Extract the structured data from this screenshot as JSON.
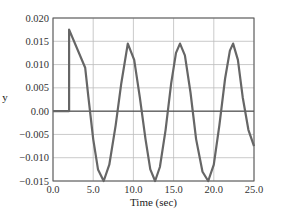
{
  "chart_data": {
    "type": "line",
    "title": "",
    "xlabel": "Time (sec)",
    "ylabel": "y",
    "xlim": [
      0.0,
      25.0
    ],
    "ylim": [
      -0.015,
      0.02
    ],
    "grid": true,
    "legend": null,
    "x_ticks": [
      0.0,
      5.0,
      10.0,
      15.0,
      20.0,
      25.0
    ],
    "x_tick_labels": [
      "0.0",
      "5.0",
      "10.0",
      "15.0",
      "20.0",
      "25.0"
    ],
    "y_ticks": [
      0.02,
      0.015,
      0.01,
      0.005,
      0.0,
      -0.005,
      -0.01,
      -0.015
    ],
    "y_tick_labels": [
      "0.020",
      "0.015",
      "0.010",
      "0.005",
      "0.00",
      "−0.005",
      "−0.010",
      "−0.015"
    ],
    "series": [
      {
        "name": "y",
        "color": "#666666",
        "x": [
          0.0,
          2.0,
          2.0,
          4.0,
          4.4,
          5.0,
          5.6,
          6.3,
          7.0,
          7.8,
          8.5,
          9.3,
          10.1,
          10.8,
          11.5,
          12.1,
          12.7,
          13.3,
          14.0,
          14.7,
          15.3,
          15.8,
          16.4,
          17.1,
          17.8,
          18.6,
          19.3,
          20.0,
          20.7,
          21.4,
          22.0,
          22.4,
          23.0,
          23.6,
          24.3,
          25.0
        ],
        "y": [
          0.0,
          0.0,
          0.0175,
          0.0093,
          0.003,
          -0.006,
          -0.0125,
          -0.015,
          -0.0115,
          -0.003,
          0.006,
          0.0145,
          0.011,
          0.003,
          -0.006,
          -0.0125,
          -0.015,
          -0.012,
          -0.004,
          0.006,
          0.0125,
          0.0145,
          0.012,
          0.004,
          -0.006,
          -0.013,
          -0.015,
          -0.0115,
          -0.003,
          0.007,
          0.013,
          0.0145,
          0.011,
          0.003,
          -0.004,
          -0.0075
        ]
      }
    ]
  },
  "plot_area": {
    "left": 53,
    "right": 254,
    "top": 18,
    "bottom": 181
  },
  "colors": {
    "line": "#666666",
    "grid": "#bdbdbd",
    "frame": "#555555",
    "zero_line": "#333333"
  }
}
